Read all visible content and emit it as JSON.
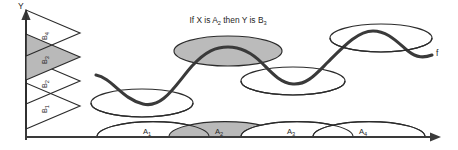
{
  "figure": {
    "title_text": "",
    "axes": {
      "y_label": "Y",
      "x_label": "",
      "y_axis_name": "vertical-axis",
      "x_axis_name": "horizontal-axis"
    },
    "rule_annotation": {
      "full": "If X is A2 then Y is B3",
      "part_if": "If X is A",
      "part_if_sub": "2",
      "part_then": " then Y is B",
      "part_then_sub": "3"
    },
    "function_label": "f",
    "colors": {
      "ink": "#2b2b2b",
      "axis": "#3a3a3a",
      "shade_gray": "#b9b9b9",
      "background": "#ffffff"
    },
    "y_sets": [
      {
        "label": "B",
        "sub": "1",
        "shaded": false
      },
      {
        "label": "B",
        "sub": "2",
        "shaded": false
      },
      {
        "label": "B",
        "sub": "3",
        "shaded": true
      },
      {
        "label": "B",
        "sub": "4",
        "shaded": false
      }
    ],
    "x_sets": [
      {
        "label": "A",
        "sub": "1",
        "shaded": false
      },
      {
        "label": "A",
        "sub": "2",
        "shaded": true
      },
      {
        "label": "A",
        "sub": "3",
        "shaded": false
      },
      {
        "label": "A",
        "sub": "4",
        "shaded": false
      }
    ],
    "fuzzy_patches": [
      {
        "name": "patch-1",
        "shaded": false
      },
      {
        "name": "patch-2",
        "shaded": true
      },
      {
        "name": "patch-3",
        "shaded": false
      },
      {
        "name": "patch-4",
        "shaded": false
      }
    ]
  }
}
